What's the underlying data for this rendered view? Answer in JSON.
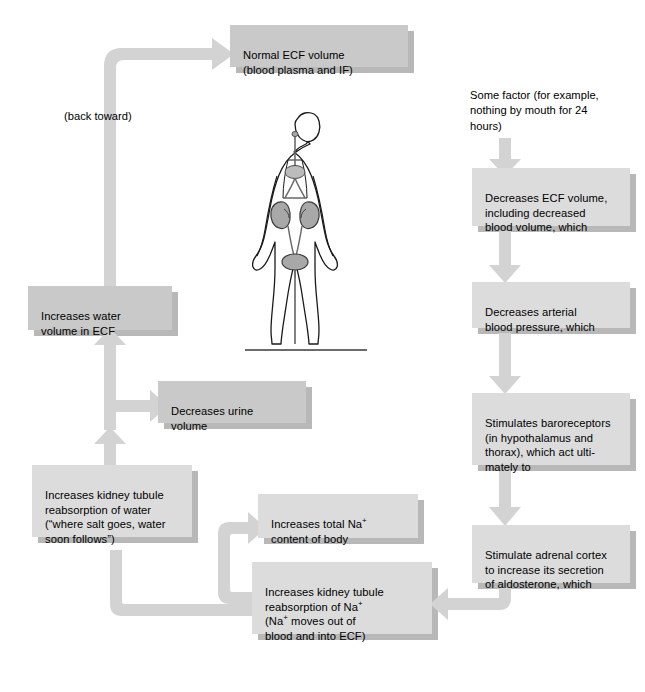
{
  "diagram": {
    "colors": {
      "box_fill_dark": "#c9c9c9",
      "box_fill_light": "#dcdcdc",
      "connector": "#d0d0d0",
      "shadow": "#b5b5b5",
      "text": "#000000",
      "organ_fill": "#a8a8a8",
      "body_outline": "#1a1a1a"
    },
    "nodes": [
      {
        "id": "normal-ecf-volume",
        "label": "Normal ECF volume\n(blood plasma and IF)",
        "shade": "dark"
      },
      {
        "id": "some-factor",
        "label": "Some factor (for example,\nnothing by mouth for 24\nhours)",
        "shade": "none"
      },
      {
        "id": "decreases-ecf-volume",
        "label": "Decreases ECF volume,\nincluding decreased\nblood volume, which",
        "shade": "light"
      },
      {
        "id": "decreases-arterial-bp",
        "label": "Decreases arterial\nblood pressure, which",
        "shade": "light"
      },
      {
        "id": "stimulates-baroreceptors",
        "label": "Stimulates baroreceptors\n(in hypothalamus and\nthorax), which act ulti-\nmately to",
        "shade": "light"
      },
      {
        "id": "stimulate-adrenal-cortex",
        "label": "Stimulate adrenal cortex\nto increase its secretion\nof aldosterone, which",
        "shade": "light"
      },
      {
        "id": "increases-na-reabsorption",
        "label_parts": [
          "Increases kidney tubule\nreabsorption of Na",
          "+",
          "\n(Na",
          "+",
          " moves out of\nblood and into ECF)"
        ],
        "shade": "light"
      },
      {
        "id": "increases-total-na",
        "label_parts": [
          "Increases total Na",
          "+",
          "\ncontent of body"
        ],
        "shade": "light"
      },
      {
        "id": "increases-water-reabsorption",
        "label": "Increases kidney tubule\nreabsorption of water\n(“where salt goes, water\nsoon follows”)",
        "shade": "light"
      },
      {
        "id": "decreases-urine-volume",
        "label": "Decreases urine\nvolume",
        "shade": "dark"
      },
      {
        "id": "increases-water-volume-ecf",
        "label": "Increases water\nvolume in ECF",
        "shade": "dark"
      }
    ],
    "annotation_back_toward": "(back toward)",
    "figure_caption": ""
  }
}
